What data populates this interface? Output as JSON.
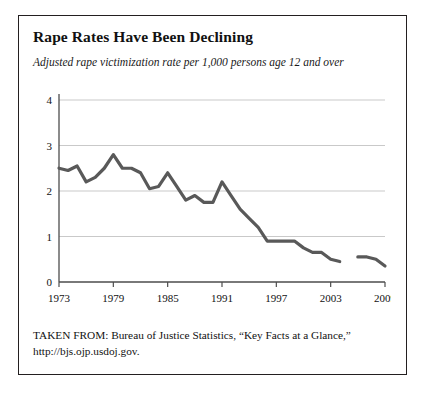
{
  "title": "Rape Rates Have Been Declining",
  "subtitle": "Adjusted rape victimization rate per 1,000 persons age 12 and over",
  "source": {
    "line1": "TAKEN FROM: Bureau of Justice Statistics, “Key Facts at a Glance,”",
    "line2": "http://bjs.ojp.usdoj.gov."
  },
  "colors": {
    "border": "#231f20",
    "line": "#595959",
    "grid": "#c9c9c9",
    "axis": "#4d4d4d",
    "text": "#111111"
  },
  "chart_data": {
    "type": "line",
    "title": "Rape Rates Have Been Declining",
    "subtitle": "Adjusted rape victimization rate per 1,000 persons age 12 and over",
    "xlabel": "",
    "ylabel": "",
    "xlim": [
      1973,
      2009
    ],
    "ylim": [
      0,
      4
    ],
    "grid": true,
    "legend": false,
    "yticks": [
      0,
      1,
      2,
      3,
      4
    ],
    "xticks": [
      1973,
      1979,
      1985,
      1991,
      1997,
      2003,
      2009
    ],
    "xtick_labels": [
      "1973",
      "1979",
      "1985",
      "1991",
      "1997",
      "2003",
      "2009"
    ],
    "ytick_labels": [
      "0",
      "1",
      "2",
      "3",
      "4"
    ],
    "series": [
      {
        "name": "Adjusted rape victimization rate",
        "x": [
          1973,
          1974,
          1975,
          1976,
          1977,
          1978,
          1979,
          1980,
          1981,
          1982,
          1983,
          1984,
          1985,
          1986,
          1987,
          1988,
          1989,
          1990,
          1991,
          1992,
          1993,
          1994,
          1995,
          1996,
          1997,
          1998,
          1999,
          2000,
          2001,
          2002,
          2003,
          2004
        ],
        "values": [
          2.5,
          2.45,
          2.55,
          2.2,
          2.3,
          2.5,
          2.8,
          2.5,
          2.5,
          2.4,
          2.05,
          2.1,
          2.4,
          2.1,
          1.8,
          1.9,
          1.75,
          1.75,
          2.2,
          1.9,
          1.6,
          1.4,
          1.2,
          0.9,
          0.9,
          0.9,
          0.9,
          0.75,
          0.65,
          0.65,
          0.5,
          0.45
        ]
      },
      {
        "name": "Adjusted rape victimization rate (redesign)",
        "x": [
          2006,
          2007,
          2008,
          2009
        ],
        "values": [
          0.55,
          0.55,
          0.5,
          0.35
        ]
      }
    ]
  }
}
